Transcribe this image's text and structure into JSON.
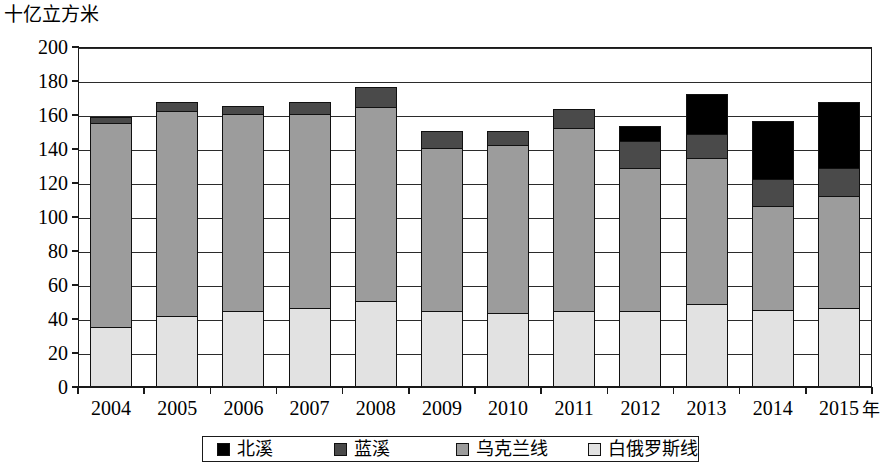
{
  "chart_data": {
    "type": "bar",
    "subtype": "stacked-bar",
    "title": "",
    "subtitle": "",
    "ylabel": "十亿立方米",
    "xlabel": "年",
    "categories": [
      "2004",
      "2005",
      "2006",
      "2007",
      "2008",
      "2009",
      "2010",
      "2011",
      "2012",
      "2013",
      "2014",
      "2015"
    ],
    "series": [
      {
        "name": "白俄罗斯线",
        "color": "#e2e2e2",
        "values": [
          35,
          41,
          44,
          46,
          50,
          44,
          43,
          44,
          44,
          48,
          45,
          46
        ]
      },
      {
        "name": "乌克兰线",
        "color": "#9c9c9c",
        "values": [
          120,
          121,
          116,
          114,
          114,
          96,
          99,
          108,
          84,
          86,
          61,
          66
        ]
      },
      {
        "name": "蓝溪",
        "color": "#4a4a4a",
        "values": [
          3,
          5,
          5,
          7,
          12,
          10,
          8,
          11,
          16,
          14,
          16,
          16
        ]
      },
      {
        "name": "北溪",
        "color": "#000000",
        "values": [
          0,
          0,
          0,
          0,
          0,
          0,
          0,
          0,
          9,
          24,
          34,
          39
        ]
      }
    ],
    "totals": [
      158,
      167,
      165,
      167,
      176,
      150,
      150,
      163,
      153,
      172,
      156,
      167
    ],
    "ylim": [
      0,
      200
    ],
    "ytick_step": 20,
    "yticks": [
      "0",
      "20",
      "40",
      "60",
      "80",
      "100",
      "120",
      "140",
      "160",
      "180",
      "200"
    ],
    "grid": true,
    "grid_axis": "y",
    "legend_position": "bottom",
    "legend_order": [
      "北溪",
      "蓝溪",
      "乌克兰线",
      "白俄罗斯线"
    ]
  },
  "legend": {
    "items": [
      {
        "label": "北溪",
        "color": "#000000"
      },
      {
        "label": "蓝溪",
        "color": "#4a4a4a"
      },
      {
        "label": "乌克兰线",
        "color": "#9c9c9c"
      },
      {
        "label": "白俄罗斯线",
        "color": "#e2e2e2"
      }
    ]
  },
  "axis": {
    "y_unit_caption": "十亿立方米",
    "x_unit_caption": "年"
  }
}
